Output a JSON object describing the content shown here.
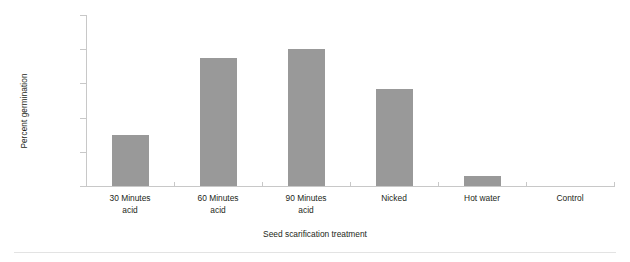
{
  "chart_data": {
    "type": "bar",
    "title": "",
    "xlabel": "Seed scarification treatment",
    "ylabel": "Percent germination",
    "categories": [
      "30 Minutes acid",
      "60 Minutes acid",
      "90 Minutes acid",
      "Nicked",
      "Hot water",
      "Control"
    ],
    "category_lines": [
      [
        "30 Minutes",
        "acid"
      ],
      [
        "60 Minutes",
        "acid"
      ],
      [
        "90 Minutes",
        "acid"
      ],
      [
        "Nicked",
        ""
      ],
      [
        "Hot water",
        ""
      ],
      [
        "Control",
        ""
      ]
    ],
    "values": [
      30,
      75,
      80,
      57,
      6,
      0
    ],
    "ylim": [
      0,
      100
    ],
    "yticks": [
      0,
      20,
      40,
      60,
      80,
      100
    ],
    "ytick_labels": [
      "0",
      "20",
      "40",
      "60",
      "80",
      "100"
    ],
    "grid": false,
    "legend": null,
    "bar_color": "#999999",
    "axis_color": "#c8c8c8",
    "text_color": "#231f20",
    "background": "#ffffff"
  }
}
